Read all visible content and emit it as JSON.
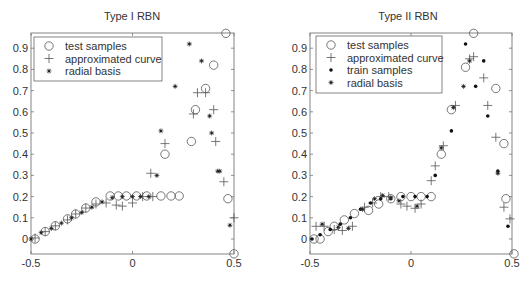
{
  "chart_data": [
    {
      "type": "scatter",
      "title": "Type I RBN",
      "xlabel": "",
      "ylabel": "",
      "xlim": [
        -0.5,
        0.5
      ],
      "ylim": [
        -0.07,
        0.97
      ],
      "xticks": [
        "-0.5",
        "0",
        "0.5"
      ],
      "xtick_values": [
        -0.5,
        0,
        0.5
      ],
      "yticks": [
        "0",
        "0.1",
        "0.2",
        "0.3",
        "0.4",
        "0.5",
        "0.6",
        "0.7",
        "0.8",
        "0.9"
      ],
      "ytick_values": [
        0,
        0.1,
        0.2,
        0.3,
        0.4,
        0.5,
        0.6,
        0.7,
        0.8,
        0.9
      ],
      "grid": false,
      "legend_position": "upper left",
      "legend": [
        "test samples",
        "approximated curve",
        "radial basis"
      ],
      "series": [
        {
          "name": "test samples",
          "marker": "circle",
          "x": [
            -0.48,
            -0.43,
            -0.38,
            -0.32,
            -0.28,
            -0.23,
            -0.18,
            -0.11,
            -0.07,
            -0.03,
            0.02,
            0.07,
            0.14,
            0.19,
            0.23,
            0.16,
            0.31,
            0.4,
            0.46,
            0.36,
            0.29,
            0.47,
            0.5
          ],
          "y": [
            0.0,
            0.035,
            0.062,
            0.095,
            0.118,
            0.146,
            0.175,
            0.203,
            0.203,
            0.203,
            0.203,
            0.203,
            0.203,
            0.203,
            0.203,
            0.4,
            0.61,
            0.82,
            0.97,
            0.71,
            0.46,
            0.19,
            -0.07
          ]
        },
        {
          "name": "approximated curve",
          "marker": "plus",
          "x": [
            -0.48,
            -0.43,
            -0.38,
            -0.32,
            -0.28,
            -0.23,
            -0.18,
            -0.13,
            -0.08,
            -0.05,
            0.0,
            0.05,
            0.1,
            0.09,
            0.16,
            0.3,
            0.32,
            0.36,
            0.4,
            0.41,
            0.45,
            0.5
          ],
          "y": [
            0.005,
            0.035,
            0.062,
            0.09,
            0.118,
            0.146,
            0.165,
            0.17,
            0.16,
            0.155,
            0.17,
            0.2,
            0.2,
            0.31,
            0.45,
            0.59,
            0.69,
            0.69,
            0.61,
            0.46,
            0.27,
            0.1
          ]
        },
        {
          "name": "radial basis",
          "marker": "star",
          "x": [
            -0.5,
            -0.45,
            -0.4,
            -0.35,
            -0.3,
            -0.25,
            -0.2,
            -0.15,
            -0.1,
            -0.05,
            0.0,
            0.04,
            0.08,
            0.12,
            0.14,
            0.21,
            0.28,
            0.34,
            0.43,
            0.38,
            0.39,
            0.42,
            0.48
          ],
          "y": [
            0.0,
            0.03,
            0.05,
            0.075,
            0.1,
            0.125,
            0.15,
            0.175,
            0.195,
            0.2,
            0.2,
            0.2,
            0.2,
            0.3,
            0.51,
            0.72,
            0.92,
            0.84,
            0.32,
            0.58,
            0.5,
            0.32,
            0.065
          ]
        }
      ]
    },
    {
      "type": "scatter",
      "title": "Type II RBN",
      "xlabel": "",
      "ylabel": "",
      "xlim": [
        -0.5,
        0.5
      ],
      "ylim": [
        -0.07,
        0.97
      ],
      "xticks": [
        "-0.5",
        "0",
        "0.5"
      ],
      "xtick_values": [
        -0.5,
        0,
        0.5
      ],
      "yticks": [
        "0",
        "0.1",
        "0.2",
        "0.3",
        "0.4",
        "0.5",
        "0.6",
        "0.7",
        "0.8",
        "0.9"
      ],
      "ytick_values": [
        0,
        0.1,
        0.2,
        0.3,
        0.4,
        0.5,
        0.6,
        0.7,
        0.8,
        0.9
      ],
      "grid": false,
      "legend_position": "upper left",
      "legend": [
        "test samples",
        "approximated curve",
        "train samples",
        "radial basis"
      ],
      "series": [
        {
          "name": "test samples",
          "marker": "circle",
          "x": [
            -0.48,
            -0.45,
            -0.41,
            -0.38,
            -0.33,
            -0.28,
            -0.21,
            -0.16,
            -0.1,
            -0.05,
            0.0,
            0.05,
            0.1,
            0.15,
            0.2,
            0.27,
            0.31,
            0.42,
            0.46,
            0.47,
            0.51
          ],
          "y": [
            0.0,
            0.0,
            0.035,
            0.06,
            0.09,
            0.12,
            0.135,
            0.165,
            0.19,
            0.2,
            0.2,
            0.2,
            0.2,
            0.4,
            0.61,
            0.81,
            0.97,
            0.71,
            0.45,
            0.19,
            -0.07
          ]
        },
        {
          "name": "approximated curve",
          "marker": "plus",
          "x": [
            -0.47,
            -0.43,
            -0.38,
            -0.34,
            -0.29,
            -0.23,
            -0.19,
            -0.15,
            -0.11,
            -0.05,
            -0.02,
            0.02,
            0.05,
            0.1,
            0.12,
            0.16,
            0.22,
            0.29,
            0.31,
            0.36,
            0.38,
            0.42,
            0.46,
            0.49
          ],
          "y": [
            0.06,
            0.06,
            0.045,
            0.04,
            0.06,
            0.15,
            0.17,
            0.2,
            0.2,
            0.165,
            0.155,
            0.145,
            0.165,
            0.275,
            0.345,
            0.44,
            0.63,
            0.85,
            0.86,
            0.76,
            0.63,
            0.48,
            0.15,
            0.095
          ]
        },
        {
          "name": "train samples",
          "marker": "dot",
          "x": [
            -0.49,
            -0.45,
            -0.4,
            -0.35,
            -0.3,
            -0.25,
            -0.2,
            -0.15,
            -0.1,
            -0.04,
            0.02,
            0.08,
            0.12,
            0.2,
            0.27,
            0.32,
            0.36,
            0.38,
            0.43,
            0.48
          ],
          "y": [
            0.0,
            0.02,
            0.045,
            0.07,
            0.1,
            0.14,
            0.17,
            0.19,
            0.19,
            0.2,
            0.2,
            0.2,
            0.3,
            0.51,
            0.92,
            0.72,
            0.84,
            0.58,
            0.32,
            0.06
          ]
        },
        {
          "name": "radial basis",
          "marker": "star",
          "x": [
            -0.44,
            -0.36,
            -0.31,
            -0.24,
            -0.18,
            -0.14,
            -0.1,
            -0.06,
            0.03,
            0.15,
            0.21,
            0.26,
            0.29,
            0.43
          ],
          "y": [
            0.07,
            0.055,
            0.05,
            0.14,
            0.19,
            0.205,
            0.195,
            0.18,
            0.155,
            0.43,
            0.62,
            0.72,
            0.84,
            0.31
          ]
        }
      ]
    }
  ]
}
